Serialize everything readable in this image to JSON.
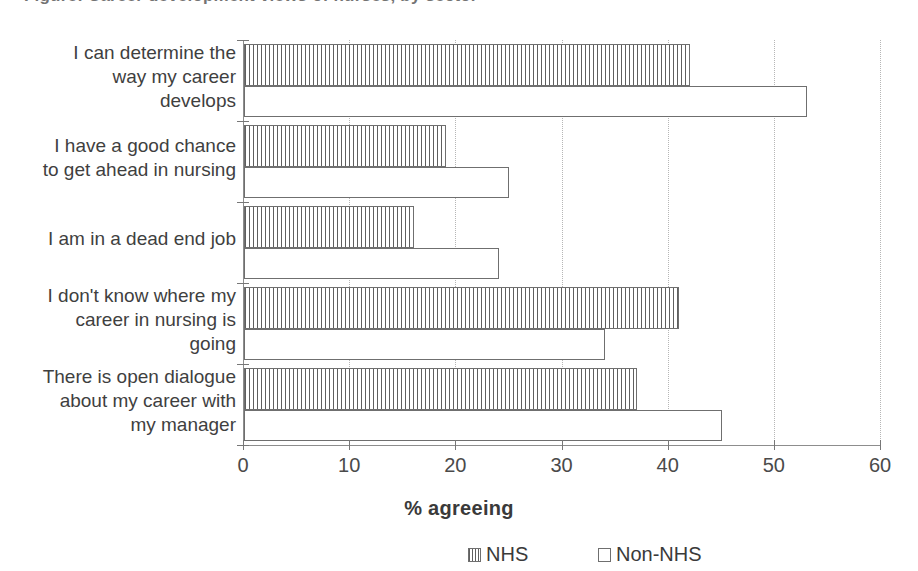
{
  "page": {
    "title_partial": "Figure: Career development views of nurses, by sector",
    "background": "#ffffff"
  },
  "chart_data": {
    "type": "bar",
    "orientation": "horizontal",
    "title": "",
    "xlabel": "% agreeing",
    "ylabel": "",
    "xlim": [
      0,
      60
    ],
    "xticks": [
      0,
      10,
      20,
      30,
      40,
      50,
      60
    ],
    "xtick_labels": [
      "0",
      "10",
      "20",
      "30",
      "40",
      "50",
      "60"
    ],
    "grid": true,
    "grid_style": "dotted-vertical",
    "legend_position": "bottom",
    "categories": [
      "I can determine the way my career develops",
      "I have a good chance to get ahead in nursing",
      "I am in a dead end job",
      "I don't know where my career in nursing is going",
      "There is open dialogue about my career with my manager"
    ],
    "category_lines": [
      [
        "I can determine the",
        "way my career",
        "develops"
      ],
      [
        "I have a good chance",
        "to get ahead in nursing"
      ],
      [
        "I am in a dead end job"
      ],
      [
        "I don't know where my",
        "career in nursing is",
        "going"
      ],
      [
        "There is open dialogue",
        "about my career with",
        "my manager"
      ]
    ],
    "series": [
      {
        "name": "NHS",
        "fill": "vertical-hatch",
        "color": "#5f5f5f",
        "values": [
          42,
          19,
          16,
          41,
          37
        ]
      },
      {
        "name": "Non-NHS",
        "fill": "white",
        "color": "#ffffff",
        "values": [
          53,
          25,
          24,
          34,
          45
        ]
      }
    ]
  },
  "legend": {
    "items": [
      {
        "label": "NHS",
        "swatch": "hatch-swatch"
      },
      {
        "label": "Non-NHS",
        "swatch": "white-swatch"
      }
    ]
  },
  "axis": {
    "x_title": "% agreeing"
  }
}
